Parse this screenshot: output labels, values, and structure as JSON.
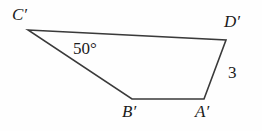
{
  "figure": {
    "type": "quadrilateral",
    "stroke_color": "#3a3a3a",
    "background_color": "#fefefe",
    "text_color": "#1b1b1b",
    "vertices": [
      {
        "name": "C-prime",
        "label": "C′",
        "x": 28,
        "y": 30
      },
      {
        "name": "D-prime",
        "label": "D′",
        "x": 226,
        "y": 40
      },
      {
        "name": "A-prime",
        "label": "A′",
        "x": 204,
        "y": 99
      },
      {
        "name": "B-prime",
        "label": "B′",
        "x": 132,
        "y": 99
      }
    ],
    "edges": [
      {
        "name": "edge-C-D",
        "from": "C-prime",
        "to": "D-prime"
      },
      {
        "name": "edge-D-A",
        "from": "D-prime",
        "to": "A-prime"
      },
      {
        "name": "edge-A-B",
        "from": "A-prime",
        "to": "B-prime"
      },
      {
        "name": "edge-B-C",
        "from": "B-prime",
        "to": "C-prime"
      }
    ],
    "annotations": {
      "angle_at_C": "50°",
      "side_D_A_length": "3"
    }
  }
}
